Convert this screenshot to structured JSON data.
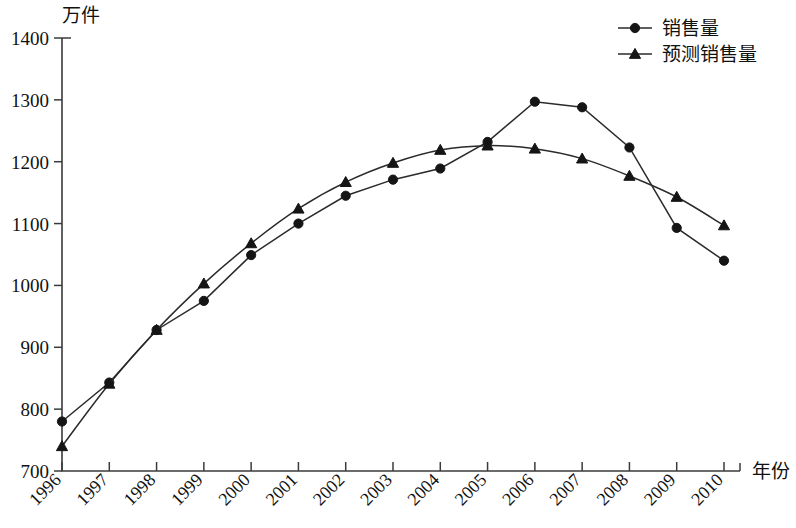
{
  "chart_data": {
    "type": "line",
    "title": "",
    "xlabel": "年份",
    "ylabel": "万件",
    "x": [
      1996,
      1997,
      1998,
      1999,
      2000,
      2001,
      2002,
      2003,
      2004,
      2005,
      2006,
      2007,
      2008,
      2009,
      2010
    ],
    "categories": [
      "1996",
      "1997",
      "1998",
      "1999",
      "2000",
      "2001",
      "2002",
      "2003",
      "2004",
      "2005",
      "2006",
      "2007",
      "2008",
      "2009",
      "2010"
    ],
    "xlim": [
      1996,
      2010
    ],
    "ylim": [
      700,
      1400
    ],
    "ytick_labels": [
      "700",
      "800",
      "900",
      "1000",
      "1100",
      "1200",
      "1300",
      "1400"
    ],
    "ytick_values": [
      700,
      800,
      900,
      1000,
      1100,
      1200,
      1300,
      1400
    ],
    "grid": false,
    "legend_position": "top-right",
    "series": [
      {
        "name": "销售量",
        "marker": "circle",
        "color": "#151515",
        "values": [
          780,
          843,
          928,
          975,
          1049,
          1100,
          1145,
          1171,
          1189,
          1232,
          1297,
          1288,
          1223,
          1093,
          1040
        ]
      },
      {
        "name": "预测销售量",
        "marker": "triangle",
        "color": "#151515",
        "values": [
          740,
          841,
          928,
          1003,
          1068,
          1124,
          1167,
          1198,
          1219,
          1226,
          1221,
          1205,
          1177,
          1143,
          1097
        ]
      }
    ]
  },
  "legend": {
    "items": [
      {
        "label": "销售量",
        "marker": "circle"
      },
      {
        "label": "预测销售量",
        "marker": "triangle"
      }
    ]
  },
  "axes": {
    "y_unit_label": "万件",
    "x_unit_label": "年份"
  }
}
